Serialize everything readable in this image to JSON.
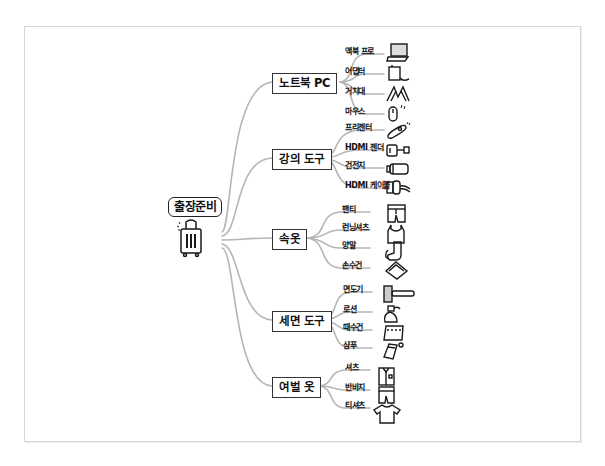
{
  "root": {
    "label": "출장준비",
    "icon": "suitcase-icon"
  },
  "branches": [
    {
      "label": "노트북 PC",
      "items": [
        {
          "label": "액북 프로",
          "icon": "laptop-icon"
        },
        {
          "label": "어댑터",
          "icon": "power-adapter-icon"
        },
        {
          "label": "거치대",
          "icon": "laptop-stand-icon"
        },
        {
          "label": "마우스",
          "icon": "mouse-icon"
        }
      ]
    },
    {
      "label": "강의 도구",
      "items": [
        {
          "label": "프리젠터",
          "icon": "presenter-remote-icon"
        },
        {
          "label": "HDMI 젠더",
          "icon": "hdmi-gender-icon"
        },
        {
          "label": "건전지",
          "icon": "battery-icon"
        },
        {
          "label": "HDMI 케이블",
          "icon": "hdmi-cable-icon"
        }
      ]
    },
    {
      "label": "속옷",
      "items": [
        {
          "label": "팬티",
          "icon": "underwear-icon"
        },
        {
          "label": "런닝셔츠",
          "icon": "tank-top-icon"
        },
        {
          "label": "양말",
          "icon": "socks-icon"
        },
        {
          "label": "손수건",
          "icon": "handkerchief-icon"
        }
      ]
    },
    {
      "label": "세면 도구",
      "items": [
        {
          "label": "면도기",
          "icon": "razor-icon"
        },
        {
          "label": "로션",
          "icon": "lotion-bottle-icon"
        },
        {
          "label": "때수건",
          "icon": "scrub-towel-icon"
        },
        {
          "label": "샴푸",
          "icon": "shampoo-pouch-icon"
        }
      ]
    },
    {
      "label": "여벌 옷",
      "items": [
        {
          "label": "셔츠",
          "icon": "shirt-icon"
        },
        {
          "label": "반바지",
          "icon": "shorts-icon"
        },
        {
          "label": "티셔츠",
          "icon": "t-shirt-icon"
        }
      ]
    }
  ],
  "colors": {
    "line": "#b5b5b5",
    "ink": "#1a1a1a",
    "frame": "#d6d6d6"
  }
}
